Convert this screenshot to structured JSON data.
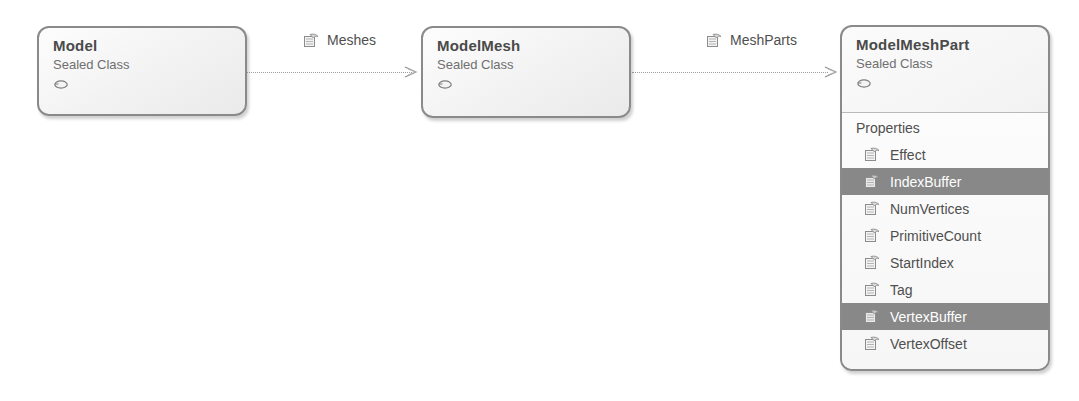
{
  "diagram": {
    "type": "uml-class-diagram",
    "background_color": "#ffffff",
    "line_color": "#9e9e9e",
    "selection_color": "#888888",
    "border_color": "#8a8a8a",
    "text_color": "#4f4f4f"
  },
  "classes": [
    {
      "id": "model",
      "name": "Model",
      "stereotype": "Sealed Class",
      "sealed_icon": "sealed-oval-icon"
    },
    {
      "id": "model-mesh",
      "name": "ModelMesh",
      "stereotype": "Sealed Class",
      "sealed_icon": "sealed-oval-icon"
    },
    {
      "id": "model-mesh-part",
      "name": "ModelMeshPart",
      "stereotype": "Sealed Class",
      "sealed_icon": "sealed-oval-icon",
      "compartment": {
        "title": "Properties",
        "members": [
          {
            "name": "Effect",
            "icon": "property-icon",
            "selected": false
          },
          {
            "name": "IndexBuffer",
            "icon": "property-icon",
            "selected": true
          },
          {
            "name": "NumVertices",
            "icon": "property-icon",
            "selected": false
          },
          {
            "name": "PrimitiveCount",
            "icon": "property-icon",
            "selected": false
          },
          {
            "name": "StartIndex",
            "icon": "property-icon",
            "selected": false
          },
          {
            "name": "Tag",
            "icon": "property-icon",
            "selected": false
          },
          {
            "name": "VertexBuffer",
            "icon": "property-icon",
            "selected": true
          },
          {
            "name": "VertexOffset",
            "icon": "property-icon",
            "selected": false
          }
        ]
      }
    }
  ],
  "associations": [
    {
      "id": "meshes",
      "label": "Meshes",
      "icon": "property-icon",
      "from": "model",
      "to": "model-mesh"
    },
    {
      "id": "mesh-parts",
      "label": "MeshParts",
      "icon": "property-icon",
      "from": "model-mesh",
      "to": "model-mesh-part"
    }
  ]
}
